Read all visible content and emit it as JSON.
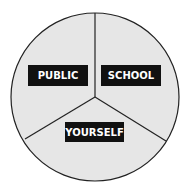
{
  "diagram": {
    "type": "three-sector-circle",
    "fill_color": "#e6e6e6",
    "stroke_color": "#222222",
    "label_bg": "#111111",
    "label_fg": "#ffffff",
    "sectors": [
      {
        "label": "PUBLIC"
      },
      {
        "label": "SCHOOL"
      },
      {
        "label": "YOURSELF"
      }
    ]
  }
}
